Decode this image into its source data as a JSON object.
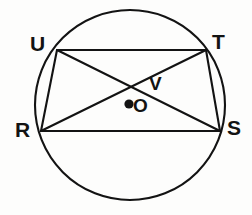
{
  "figure": {
    "kind": "geometry-diagram",
    "background_color": "#fdfdfc",
    "stroke_color": "#131313",
    "label_color": "#131313",
    "circle": {
      "center_label": "O",
      "center_x": 130,
      "center_y": 105,
      "radius": 95,
      "stroke_width": 2.1
    },
    "center_dot": {
      "label": "O",
      "x": 129,
      "y": 104,
      "radius": 4.6
    },
    "vertices": [
      {
        "label": "U",
        "x": 57,
        "y": 50,
        "label_x": 30,
        "label_y": 33
      },
      {
        "label": "T",
        "x": 206,
        "y": 50,
        "label_x": 212,
        "label_y": 31
      },
      {
        "label": "R",
        "x": 41,
        "y": 131,
        "label_x": 15,
        "label_y": 119
      },
      {
        "label": "S",
        "x": 220,
        "y": 131,
        "label_x": 227,
        "label_y": 117
      }
    ],
    "intersection": {
      "label": "V",
      "x": 135,
      "y": 85,
      "label_x": 149,
      "label_y": 74
    },
    "sides": [
      {
        "name": "UT",
        "from": "U",
        "to": "T"
      },
      {
        "name": "TS",
        "from": "T",
        "to": "S"
      },
      {
        "name": "SR",
        "from": "S",
        "to": "R"
      },
      {
        "name": "RU",
        "from": "R",
        "to": "U"
      }
    ],
    "diagonals": [
      {
        "name": "US",
        "from": "U",
        "to": "S"
      },
      {
        "name": "RT",
        "from": "R",
        "to": "T"
      }
    ]
  }
}
